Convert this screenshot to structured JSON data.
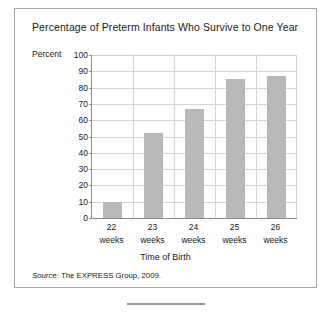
{
  "chart_data": {
    "type": "bar",
    "title": "Percentage of Preterm Infants Who Survive to One Year",
    "xlabel": "Time of Birth",
    "ylabel": "Percent",
    "categories": [
      "22 weeks",
      "23 weeks",
      "24 weeks",
      "25 weeks",
      "26 weeks"
    ],
    "category_numbers": [
      "22",
      "23",
      "24",
      "25",
      "26"
    ],
    "category_units": [
      "weeks",
      "weeks",
      "weeks",
      "weeks",
      "weeks"
    ],
    "values": [
      10,
      52,
      67,
      85,
      87
    ],
    "ylim": [
      0,
      100
    ],
    "ytick_labels": [
      "100",
      "90",
      "80",
      "70",
      "60",
      "50",
      "40",
      "30",
      "20",
      "10",
      "0"
    ],
    "ytick_values": [
      100,
      90,
      80,
      70,
      60,
      50,
      40,
      30,
      20,
      10,
      0
    ],
    "grid": true,
    "legend": "none",
    "bar_color": "#b9b9b9",
    "axis_color": "#8c8c8c",
    "grid_color": "#d6d6d6",
    "text_color": "#1b1b1b"
  },
  "source": {
    "label": "Source:",
    "text": "The EXPRESS Group, 2009."
  },
  "frame": {
    "border_color": "#a7a7a7"
  }
}
